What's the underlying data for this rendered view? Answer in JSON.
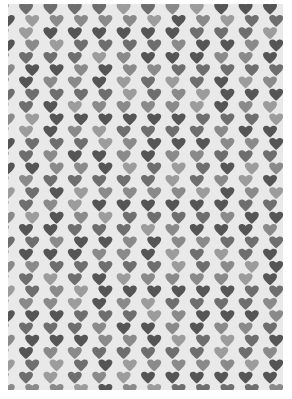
{
  "image": {
    "description": "Gray heart pattern textile/paper",
    "background_color": "#e9e9e9",
    "page_color": "#ffffff",
    "shade_colors": [
      "#555555",
      "#6e6e6e",
      "#8a8a8a",
      "#9c9c9c"
    ],
    "layout": {
      "col_spacing": 24.4,
      "row_spacing": 12.3,
      "heart_size": 14,
      "first_row_offset_x": 19,
      "odd_row_offset_x": 6.8,
      "rows": 32,
      "cols": 12
    },
    "shade_sequence": [
      1,
      0,
      2,
      1,
      0,
      3,
      0,
      1,
      2,
      0,
      1,
      2,
      0,
      3,
      1,
      2,
      0,
      1,
      3,
      0,
      2,
      1,
      0,
      2,
      3,
      1,
      0,
      2,
      1,
      3,
      0,
      2,
      1,
      0,
      2,
      3,
      1,
      2,
      0,
      1,
      0,
      2,
      1,
      3,
      2,
      0,
      1,
      0,
      3,
      2,
      1
    ]
  }
}
